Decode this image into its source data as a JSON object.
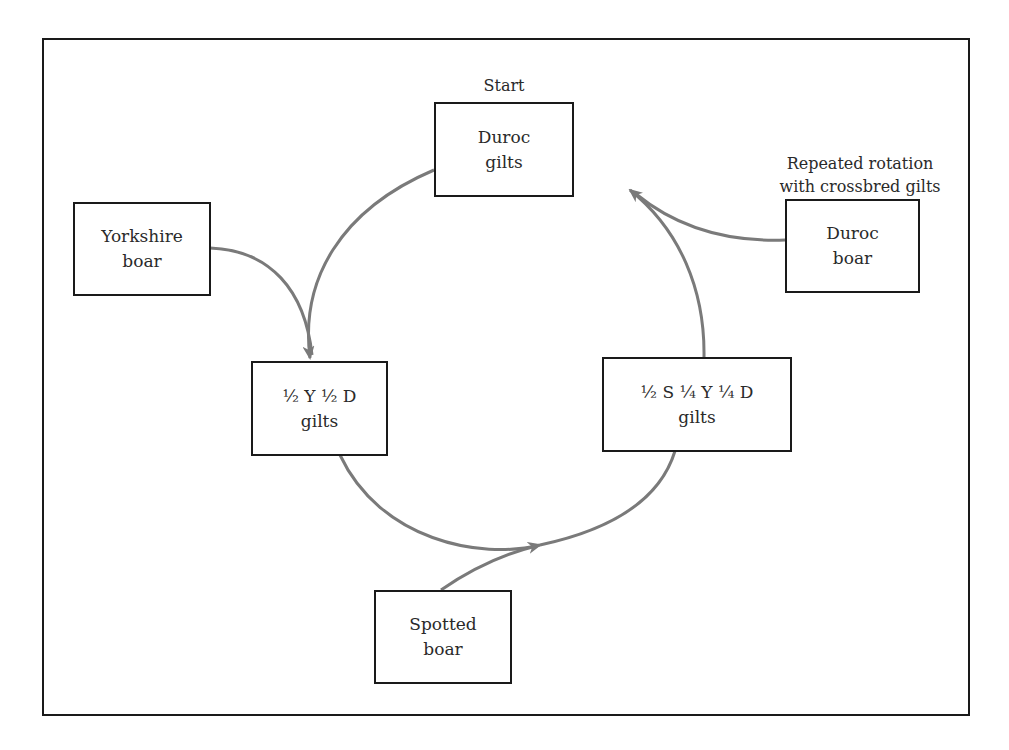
{
  "diagram": {
    "type": "crossbreeding rotation cycle",
    "start_label": "Start",
    "rotation_label": {
      "line1": "Repeated rotation",
      "line2": "with crossbred gilts"
    },
    "nodes": {
      "duroc_gilts": {
        "line1": "Duroc",
        "line2": "gilts"
      },
      "yorkshire_boar": {
        "line1": "Yorkshire",
        "line2": "boar"
      },
      "duroc_boar": {
        "line1": "Duroc",
        "line2": "boar"
      },
      "half_y_half_d_gilts": {
        "line1": "½ Y ½ D",
        "line2": "gilts"
      },
      "half_s_quarter_y_quarter_d_gilts": {
        "line1": "½ S ¼ Y ¼ D",
        "line2": "gilts"
      },
      "spotted_boar": {
        "line1": "Spotted",
        "line2": "boar"
      }
    },
    "edges": [
      {
        "from": "duroc_gilts",
        "to": "half_y_half_d_gilts"
      },
      {
        "from": "yorkshire_boar",
        "to": "half_y_half_d_gilts"
      },
      {
        "from": "half_y_half_d_gilts",
        "to": "half_s_quarter_y_quarter_d_gilts"
      },
      {
        "from": "spotted_boar",
        "to": "half_s_quarter_y_quarter_d_gilts"
      },
      {
        "from": "half_s_quarter_y_quarter_d_gilts",
        "to": "duroc_gilts"
      },
      {
        "from": "duroc_boar",
        "to": "duroc_gilts"
      }
    ],
    "colors": {
      "arrow": "#7a7a7a",
      "border": "#1a1a1a",
      "text": "#2a2a2a"
    }
  }
}
